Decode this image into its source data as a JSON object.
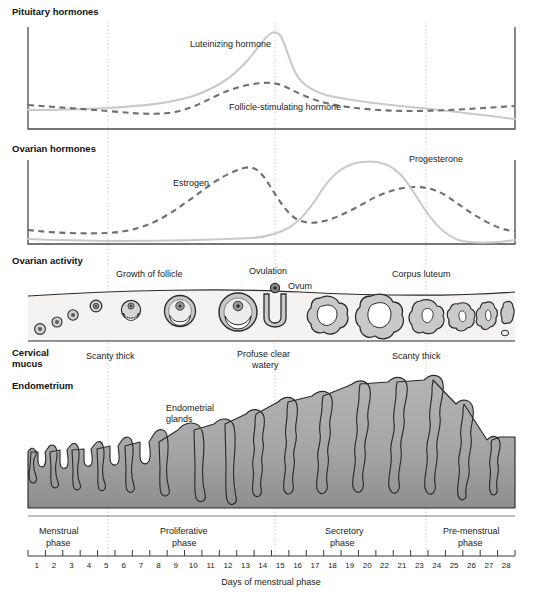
{
  "figure": {
    "caption": "Days of menstrual phase"
  },
  "panels": {
    "pituitary": {
      "title": "Pituitary hormones",
      "curves": [
        {
          "name": "Luteinizing hormone",
          "label": "Luteinizing\nhormone",
          "style": "solid",
          "color": "#c9c9c9"
        },
        {
          "name": "Follicle-stimulating hormone",
          "label": "Follicle-stimulating\nhormone",
          "style": "dashed",
          "color": "#6f6f6f"
        }
      ]
    },
    "ovarian_hormones": {
      "title": "Ovarian hormones",
      "curves": [
        {
          "name": "Estrogen",
          "label": "Estrogen",
          "style": "dashed",
          "color": "#6f6f6f"
        },
        {
          "name": "Progesterone",
          "label": "Progesterone",
          "style": "solid",
          "color": "#c9c9c9"
        }
      ]
    },
    "ovarian_activity": {
      "title": "Ovarian activity",
      "annotations": [
        {
          "name": "growth-of-follicle",
          "text": "Growth of follicle"
        },
        {
          "name": "ovulation",
          "text": "Ovulation"
        },
        {
          "name": "ovum",
          "text": "Ovum"
        },
        {
          "name": "corpus-luteum",
          "text": "Corpus luteum"
        }
      ]
    },
    "cervical_mucus": {
      "title": "Cervical\nmucus",
      "annotations": [
        {
          "name": "mucus-scanty-thick-early",
          "text": "Scanty thick"
        },
        {
          "name": "mucus-profuse-clear-watery",
          "text": "Profuse clear\nwatery"
        },
        {
          "name": "mucus-scanty-thick-late",
          "text": "Scanty thick"
        }
      ]
    },
    "endometrium": {
      "title": "Endometrium",
      "annotations": [
        {
          "name": "endometrial-glands",
          "text": "Endometrial\nglands"
        }
      ]
    }
  },
  "phases": [
    {
      "name": "menstrual",
      "label": "Menstrual\nphase",
      "start_day": 1,
      "end_day": 5
    },
    {
      "name": "proliferative",
      "label": "Proliferative\nphase",
      "start_day": 5,
      "end_day": 14
    },
    {
      "name": "secretory",
      "label": "Secretory\nphase",
      "start_day": 14,
      "end_day": 23
    },
    {
      "name": "pre-menstrual",
      "label": "Pre-menstrual\nphase",
      "start_day": 23,
      "end_day": 28
    }
  ],
  "axis": {
    "label": "Days of menstrual phase",
    "tick_labels": [
      "1",
      "2",
      "3",
      "4",
      "5",
      "6",
      "7",
      "8",
      "9",
      "10",
      "11",
      "12",
      "13",
      "14",
      "15",
      "16",
      "17",
      "18",
      "19",
      "20",
      "22",
      "21",
      "23",
      "24",
      "25",
      "26",
      "27",
      "28"
    ]
  },
  "colors": {
    "solid_curve": "#c9c9c9",
    "dashed_curve": "#6f6f6f",
    "axis": "#4a4a4a",
    "guide_line": "#b6b6b6",
    "ovary_fill": "#f4f3f1",
    "follicle_fill": "#d6d6d6",
    "endometrium_fill": "#a8a8a8",
    "outline": "#2b2b2b",
    "text": "#1a1a1a"
  },
  "chart_data": {
    "type": "line",
    "xlabel": "Days of menstrual phase",
    "ylabel": "",
    "x": [
      1,
      2,
      3,
      4,
      5,
      6,
      7,
      8,
      9,
      10,
      11,
      12,
      13,
      14,
      15,
      16,
      17,
      18,
      19,
      20,
      21,
      22,
      23,
      24,
      25,
      26,
      27,
      28
    ],
    "xlim": [
      1,
      28
    ],
    "grid": false,
    "guide_days": [
      5,
      14,
      23
    ],
    "legend": "inline-labels",
    "subcharts": [
      {
        "name": "pituitary-hormones",
        "title": "Pituitary hormones",
        "series": [
          {
            "name": "Luteinizing hormone",
            "style": "solid",
            "color": "#c9c9c9",
            "values": [
              8,
              8,
              8,
              8,
              8,
              9,
              9,
              10,
              11,
              12,
              14,
              18,
              30,
              72,
              96,
              55,
              38,
              32,
              29,
              27,
              25,
              24,
              23,
              22,
              20,
              18,
              15,
              12
            ]
          },
          {
            "name": "Follicle-stimulating hormone",
            "style": "dashed",
            "color": "#6f6f6f",
            "values": [
              22,
              21,
              20,
              19,
              18,
              16,
              15,
              14,
              14,
              15,
              17,
              22,
              30,
              40,
              44,
              38,
              30,
              25,
              22,
              20,
              19,
              18,
              18,
              18,
              19,
              20,
              21,
              22
            ]
          }
        ]
      },
      {
        "name": "ovarian-hormones",
        "title": "Ovarian hormones",
        "series": [
          {
            "name": "Estrogen",
            "style": "dashed",
            "color": "#6f6f6f",
            "values": [
              16,
              15,
              14,
              14,
              14,
              16,
              20,
              26,
              34,
              46,
              60,
              74,
              82,
              78,
              58,
              36,
              28,
              30,
              34,
              40,
              46,
              50,
              52,
              50,
              44,
              34,
              24,
              18
            ]
          },
          {
            "name": "Progesterone",
            "style": "solid",
            "color": "#c9c9c9",
            "values": [
              5,
              5,
              5,
              5,
              5,
              5,
              5,
              5,
              5,
              5,
              5,
              6,
              7,
              9,
              16,
              34,
              58,
              78,
              88,
              92,
              90,
              82,
              66,
              42,
              22,
              10,
              6,
              6
            ]
          }
        ]
      }
    ],
    "ovarian_activity_stages": [
      {
        "day": 1,
        "stage": "primordial follicle"
      },
      {
        "day": 2,
        "stage": "primordial follicle"
      },
      {
        "day": 3,
        "stage": "primary follicle"
      },
      {
        "day": 4,
        "stage": "primary follicle"
      },
      {
        "day": 6,
        "stage": "secondary follicle"
      },
      {
        "day": 9,
        "stage": "growing follicle"
      },
      {
        "day": 12,
        "stage": "mature Graafian follicle"
      },
      {
        "day": 14,
        "stage": "ovulation / ovum released"
      },
      {
        "day": 17,
        "stage": "corpus luteum"
      },
      {
        "day": 20,
        "stage": "corpus luteum (maximum)"
      },
      {
        "day": 23,
        "stage": "corpus luteum regressing"
      },
      {
        "day": 25,
        "stage": "corpus albicans"
      },
      {
        "day": 27,
        "stage": "corpus albicans"
      },
      {
        "day": 28,
        "stage": "corpus albicans (vestigial)"
      }
    ],
    "cervical_mucus_states": [
      {
        "days": "1-5",
        "state": "Scanty thick"
      },
      {
        "days": "5-14",
        "state": "Scanty thick"
      },
      {
        "days": "14",
        "state": "Profuse clear watery"
      },
      {
        "days": "15-28",
        "state": "Scanty thick"
      }
    ],
    "endometrium_thickness": [
      {
        "day": 1,
        "relative_thickness": 14
      },
      {
        "day": 2,
        "relative_thickness": 12
      },
      {
        "day": 3,
        "relative_thickness": 13
      },
      {
        "day": 4,
        "relative_thickness": 14
      },
      {
        "day": 5,
        "relative_thickness": 16
      },
      {
        "day": 6,
        "relative_thickness": 20
      },
      {
        "day": 7,
        "relative_thickness": 24
      },
      {
        "day": 8,
        "relative_thickness": 28
      },
      {
        "day": 9,
        "relative_thickness": 34
      },
      {
        "day": 10,
        "relative_thickness": 40
      },
      {
        "day": 11,
        "relative_thickness": 44
      },
      {
        "day": 12,
        "relative_thickness": 48
      },
      {
        "day": 13,
        "relative_thickness": 52
      },
      {
        "day": 14,
        "relative_thickness": 56
      },
      {
        "day": 15,
        "relative_thickness": 62
      },
      {
        "day": 16,
        "relative_thickness": 66
      },
      {
        "day": 17,
        "relative_thickness": 70
      },
      {
        "day": 18,
        "relative_thickness": 76
      },
      {
        "day": 19,
        "relative_thickness": 84
      },
      {
        "day": 20,
        "relative_thickness": 92
      },
      {
        "day": 21,
        "relative_thickness": 96
      },
      {
        "day": 22,
        "relative_thickness": 100
      },
      {
        "day": 23,
        "relative_thickness": 98
      },
      {
        "day": 24,
        "relative_thickness": 88
      },
      {
        "day": 25,
        "relative_thickness": 74
      },
      {
        "day": 26,
        "relative_thickness": 60
      },
      {
        "day": 27,
        "relative_thickness": 46
      },
      {
        "day": 28,
        "relative_thickness": 38
      }
    ]
  }
}
